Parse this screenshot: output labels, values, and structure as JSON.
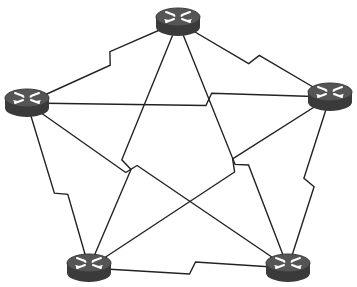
{
  "diagram": {
    "colors": {
      "background": "#ffffff",
      "link": "#222222",
      "router_body": "#3a3a3a",
      "router_top": "#555555",
      "router_arrows": "#ffffff"
    },
    "nodes": [
      {
        "id": "R1",
        "icon": "router-icon",
        "x": 178,
        "y": 22
      },
      {
        "id": "R2",
        "icon": "router-icon",
        "x": 27,
        "y": 103
      },
      {
        "id": "R3",
        "icon": "router-icon",
        "x": 330,
        "y": 97
      },
      {
        "id": "R4",
        "icon": "router-icon",
        "x": 89,
        "y": 268
      },
      {
        "id": "R5",
        "icon": "router-icon",
        "x": 288,
        "y": 268
      }
    ],
    "links": [
      {
        "from": "R1",
        "to": "R2",
        "type": "serial",
        "zig": 0.45
      },
      {
        "from": "R1",
        "to": "R3",
        "type": "serial",
        "zig": 0.5
      },
      {
        "from": "R1",
        "to": "R4",
        "type": "serial",
        "zig": 0.58
      },
      {
        "from": "R1",
        "to": "R5",
        "type": "serial",
        "zig": 0.58
      },
      {
        "from": "R2",
        "to": "R3",
        "type": "serial",
        "zig": 0.6
      },
      {
        "from": "R2",
        "to": "R4",
        "type": "serial",
        "zig": 0.55
      },
      {
        "from": "R2",
        "to": "R5",
        "type": "serial",
        "zig": 0.4
      },
      {
        "from": "R3",
        "to": "R4",
        "type": "serial",
        "zig": 0.4
      },
      {
        "from": "R3",
        "to": "R5",
        "type": "serial",
        "zig": 0.5
      },
      {
        "from": "R4",
        "to": "R5",
        "type": "serial",
        "zig": 0.52
      }
    ]
  }
}
